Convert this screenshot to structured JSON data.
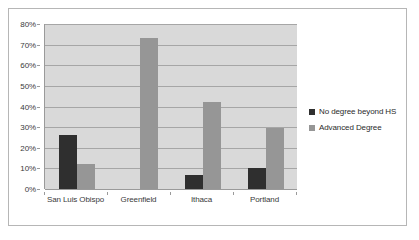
{
  "chart_data": {
    "type": "bar",
    "title": "",
    "subtitle": "",
    "xlabel": "",
    "ylabel": "",
    "categories": [
      "San Luis Obispo",
      "Greenfield",
      "Ithaca",
      "Portland"
    ],
    "series": [
      {
        "name": "No degree beyond HS",
        "color": "#2f2f2f",
        "values": [
          26,
          0,
          7,
          10
        ]
      },
      {
        "name": "Advanced Degree",
        "color": "#969696",
        "values": [
          12,
          73,
          42,
          29.5
        ]
      }
    ],
    "ylim": [
      0,
      80
    ],
    "y_tick_step": 10,
    "y_tick_labels": [
      "0%",
      "10%",
      "20%",
      "30%",
      "40%",
      "50%",
      "60%",
      "70%",
      "80%"
    ],
    "y_tick_values": [
      0,
      10,
      20,
      30,
      40,
      50,
      60,
      70,
      80
    ],
    "grid": true,
    "legend_position": "right",
    "plot_background": "#d9d9d9",
    "gridline_color": "#a6a6a6",
    "border_color": "#b6b6b6"
  }
}
